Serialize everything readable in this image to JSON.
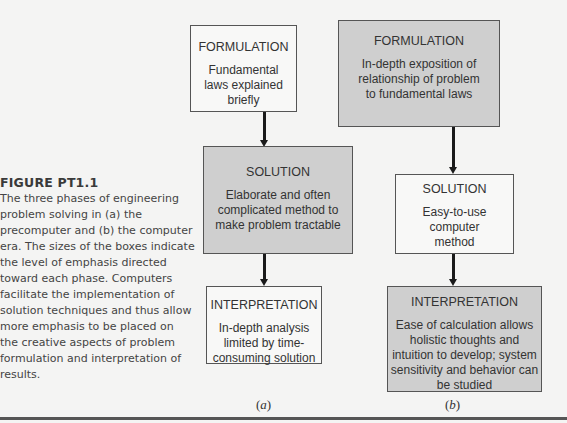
{
  "figure": {
    "label": "FIGURE PT1.1",
    "caption": "The three phases of engineering problem solving in (a) the precomputer and (b) the computer era. The sizes of the boxes indicate the level of emphasis directed toward each phase. Computers facilitate the implementation of solution techniques and thus allow more emphasis to be placed on the creative aspects of problem formulation and interpretation of results."
  },
  "panels": [
    {
      "label": "(a)",
      "label_letter": "a",
      "era": "precomputer",
      "phases": [
        {
          "title": "FORMULATION",
          "description": "Fundamental laws explained briefly",
          "emphasis": "low"
        },
        {
          "title": "SOLUTION",
          "description": "Elaborate and often complicated method to make problem tractable",
          "emphasis": "high"
        },
        {
          "title": "INTERPRETATION",
          "description": "In-depth analysis limited by time-consuming solution",
          "emphasis": "low"
        }
      ]
    },
    {
      "label": "(b)",
      "label_letter": "b",
      "era": "computer",
      "phases": [
        {
          "title": "FORMULATION",
          "description": "In-depth exposition of relationship of problem to fundamental laws",
          "emphasis": "high"
        },
        {
          "title": "SOLUTION",
          "description": "Easy-to-use computer method",
          "emphasis": "low"
        },
        {
          "title": "INTERPRETATION",
          "description": "Ease of calculation allows holistic thoughts and intuition to develop; system sensitivity and behavior can be studied",
          "emphasis": "high"
        }
      ]
    }
  ],
  "colors": {
    "background": "#f4f4f3",
    "shaded_box": "#cfcfcf",
    "plain_box": "#f8f8f7",
    "border": "#555555",
    "arrow": "#1a1a1a"
  }
}
